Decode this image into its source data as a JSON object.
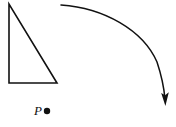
{
  "figure": {
    "background_color": "#ffffff",
    "stroke_color": "#111111",
    "width": 176,
    "height": 127,
    "shapes": {
      "triangle": {
        "name": "right-triangle",
        "type": "polygon",
        "stroke_color": "#111111",
        "stroke_width": 1.6,
        "fill": "none",
        "vertices": [
          {
            "label": "apex",
            "x": 9,
            "y": 4
          },
          {
            "label": "right-angle",
            "x": 9,
            "y": 83
          },
          {
            "label": "base-right",
            "x": 57,
            "y": 83
          }
        ],
        "points_attr": "9,4 9,83 57,83"
      },
      "point_marker": {
        "name": "point-P-dot",
        "type": "circle",
        "cx": 47,
        "cy": 111,
        "r": 3.2,
        "fill": "#111111"
      },
      "point_label": {
        "name": "point-P-label",
        "text": "P",
        "x": 34,
        "y": 115,
        "font_style": "italic"
      },
      "arrow": {
        "name": "curved-rotation-arrow",
        "type": "path",
        "stroke_color": "#111111",
        "stroke_width": 1.5,
        "fill": "none",
        "start": {
          "x": 61,
          "y": 5
        },
        "end": {
          "x": 165,
          "y": 100
        },
        "path_d": "M 61 5 C 104 8, 143 30, 157 62 C 161 74, 164 88, 165 99",
        "arrowhead": {
          "name": "arrowhead",
          "points_attr": "161.2,93 165.4,106 168.8,92.2 165.1,95.2",
          "fill": "#111111"
        }
      }
    }
  }
}
